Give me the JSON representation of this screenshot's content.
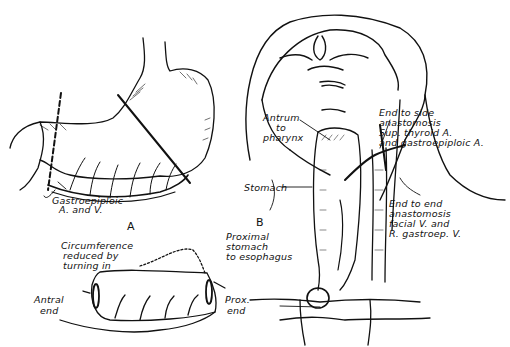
{
  "figure": {
    "panel_a": {
      "letter": "A",
      "vessel_label_line1": "Gastroepiploic",
      "vessel_label_line2": "A. and V."
    },
    "panel_b": {
      "letter": "B",
      "antrum_line1": "Antrum",
      "antrum_line2": "to",
      "antrum_line3": "pharynx",
      "stomach": "Stomach",
      "end_to_side_line1": "End to side",
      "end_to_side_line2": "anastomosis",
      "end_to_side_line3": "Sup. thyroid A.",
      "end_to_side_line4": "and gastroepiploic A.",
      "end_to_end_line1": "End to end",
      "end_to_end_line2": "anastomosis",
      "end_to_end_line3": "facial V. and",
      "end_to_end_line4": "R. gastroep. V.",
      "proximal_line1": "Proximal",
      "proximal_line2": "stomach",
      "proximal_line3": "to esophagus"
    },
    "tube_detail": {
      "circ_line1": "Circumference",
      "circ_line2": "reduced by",
      "circ_line3": "turning in",
      "antral_line1": "Antral",
      "antral_line2": "end",
      "prox_line1": "Prox.",
      "prox_line2": "end"
    }
  }
}
